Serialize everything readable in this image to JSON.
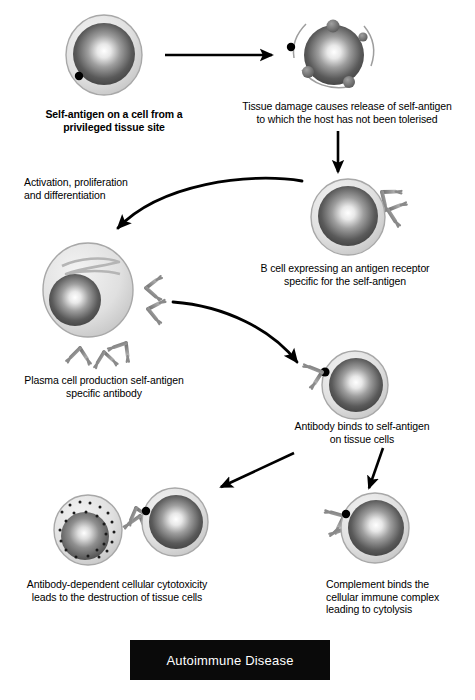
{
  "figure": {
    "title": "Autoimmune Disease"
  },
  "captions": {
    "self_antigen": "Self-antigen on a cell from a\nprivileged tissue site",
    "tissue_damage": "Tissue damage causes release of self-antigen\nto which the host has not been tolerised",
    "activation": "Activation, proliferation\nand differentiation",
    "b_cell": "B cell expressing an antigen receptor\nspecific for the self-antigen",
    "plasma_cell": "Plasma cell production self-antigen\nspecific antibody",
    "antibody_binds": "Antibody binds to self-antigen\non tissue cells",
    "adcc": "Antibody-dependent cellular cytotoxicity\nleads to the destruction of tissue cells",
    "complement": "Complement binds the\ncellular immune complex\nleading to cytolysis"
  },
  "cells": [
    {
      "id": "privileged-tissue-cell",
      "label": "Self-antigen on a cell from a privileged tissue site",
      "cx": 104,
      "cy": 55,
      "r": 38,
      "antigen_dots": 1
    },
    {
      "id": "damaged-tissue-cell",
      "label": "Tissue damage causes release of self-antigen",
      "cx": 334,
      "cy": 55,
      "r": 30,
      "blebs": 4,
      "released_antigen": true
    },
    {
      "id": "b-cell",
      "label": "B cell expressing an antigen receptor specific for the self-antigen",
      "cx": 348,
      "cy": 217,
      "r": 36,
      "receptors": 2
    },
    {
      "id": "plasma-cell",
      "label": "Plasma cell production self-antigen specific antibody",
      "cx": 88,
      "cy": 290,
      "r": 46,
      "secreted_antibodies": 5
    },
    {
      "id": "antibody-bound-tissue-cell",
      "label": "Antibody binds to self-antigen on tissue cells",
      "cx": 355,
      "cy": 385,
      "r": 32,
      "bound_antibodies": 1
    },
    {
      "id": "effector-killer-cell",
      "label": "Antibody-dependent cellular cytotoxicity effector cell",
      "cx": 88,
      "cy": 530,
      "r": 34,
      "granules": true
    },
    {
      "id": "adcc-target-tissue-cell",
      "label": "Tissue cell destroyed by ADCC",
      "cx": 175,
      "cy": 522,
      "r": 32
    },
    {
      "id": "complement-tissue-cell",
      "label": "Complement binds the cellular immune complex",
      "cx": 375,
      "cy": 528,
      "r": 34,
      "bound_antibodies": 2
    }
  ],
  "arrows": [
    {
      "id": "arrow-damage",
      "type": "straight",
      "from": [
        165,
        55
      ],
      "to": [
        277,
        55
      ]
    },
    {
      "id": "arrow-to-bcell",
      "type": "straight",
      "from": [
        338,
        130
      ],
      "to": [
        338,
        176
      ]
    },
    {
      "id": "arrow-activation",
      "type": "curved",
      "from": [
        302,
        181
      ],
      "to": [
        113,
        233
      ]
    },
    {
      "id": "arrow-to-tissue",
      "type": "curved",
      "from": [
        173,
        302
      ],
      "to": [
        302,
        367
      ]
    },
    {
      "id": "arrow-to-adcc",
      "type": "straight",
      "from": [
        294,
        453
      ],
      "to": [
        216,
        490
      ]
    },
    {
      "id": "arrow-to-complement",
      "type": "straight",
      "from": [
        382,
        448
      ],
      "to": [
        368,
        492
      ]
    }
  ],
  "colors": {
    "membrane_light": "#e2e2e2",
    "membrane_edge": "#9a9a9a",
    "nucleus_dark": "#4b4b4b",
    "nucleus_highlight": "#ffffff",
    "antibody_gray": "#8c8c8c",
    "antigen_black": "#000000",
    "arrow_black": "#000000",
    "banner_bg": "#0a0a0a",
    "banner_text": "#ffffff"
  }
}
